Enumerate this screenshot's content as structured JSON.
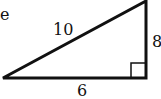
{
  "diagram": {
    "type": "right-triangle",
    "partial_text": "e",
    "sides": {
      "hypotenuse": "10",
      "vertical_leg": "8",
      "horizontal_leg": "6"
    },
    "stroke_color": "#111111",
    "right_angle_marker": true
  }
}
